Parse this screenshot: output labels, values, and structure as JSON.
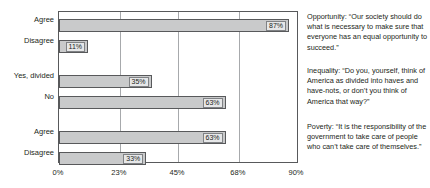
{
  "chart_data": {
    "type": "bar",
    "orientation": "horizontal",
    "title": "",
    "xlabel": "",
    "ylabel": "",
    "xlim": [
      0,
      90
    ],
    "grid": true,
    "legend": "none",
    "xticks": [
      {
        "value": 0,
        "label": "0%"
      },
      {
        "value": 23,
        "label": "23%"
      },
      {
        "value": 45,
        "label": "45%"
      },
      {
        "value": 68,
        "label": "68%"
      },
      {
        "value": 90,
        "label": "90%"
      }
    ],
    "groups": [
      {
        "name": "Opportunity",
        "annotation": "Opportunity: “Our society should do what is necessary to make sure that everyone has an equal opportunity to succeed.”",
        "bars": [
          {
            "category": "Agree",
            "value": 87,
            "label": "87%"
          },
          {
            "category": "Disagree",
            "value": 11,
            "label": "11%"
          }
        ]
      },
      {
        "name": "Inequality",
        "annotation": "Inequality: “Do you, yourself, think of America as divided into haves and have-nots, or don’t you think of America that way?”",
        "bars": [
          {
            "category": "Yes, divided",
            "value": 35,
            "label": "35%"
          },
          {
            "category": "No",
            "value": 63,
            "label": "63%"
          }
        ]
      },
      {
        "name": "Poverty",
        "annotation": "Poverty: “It is the responsibility of the government to take care of people who can’t take care of themselves.”",
        "bars": [
          {
            "category": "Agree",
            "value": 63,
            "label": "63%"
          },
          {
            "category": "Disagree",
            "value": 33,
            "label": "33%"
          }
        ]
      }
    ],
    "categories": [
      "Agree",
      "Disagree",
      "Yes, divided",
      "No",
      "Agree",
      "Disagree"
    ],
    "values": [
      87,
      11,
      35,
      63,
      63,
      33
    ],
    "value_labels": [
      "87%",
      "11%",
      "35%",
      "63%",
      "63%",
      "33%"
    ],
    "colors": {
      "bar_fill": "#c9cacb",
      "bar_border": "#58595b",
      "value_box_fill": "#e6e7e8",
      "value_box_border": "#808285",
      "gridline": "#a7a9ac",
      "plot_border": "#58595b",
      "text": "#231f20",
      "background": "#ffffff"
    }
  }
}
